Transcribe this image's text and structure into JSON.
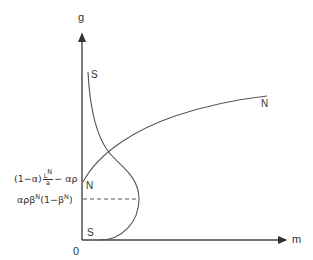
{
  "axes": {
    "y_label": "g",
    "x_label": "m",
    "origin_label": "0"
  },
  "curves": {
    "S": {
      "label_top": "S",
      "label_bottom": "S"
    },
    "N": {
      "label_start": "N",
      "label_end": "N"
    }
  },
  "y_annotations": {
    "upper": {
      "prefix": "(1−α)",
      "frac_num": "L",
      "frac_num_sup": "N",
      "frac_den": "a",
      "suffix": "− αρ"
    },
    "lower": {
      "part1": "αρβ",
      "sup1": "N",
      "part2": "(1−β",
      "sup2": "N",
      "part3": ")"
    }
  },
  "colors": {
    "line": "#444444",
    "background": "#ffffff"
  }
}
